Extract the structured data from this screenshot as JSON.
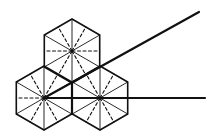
{
  "diagram": {
    "stroke_color": "#111111",
    "background": "#ffffff",
    "hexagons": [
      {
        "id": "top",
        "cx": 72,
        "cy": 51,
        "r": 32
      },
      {
        "id": "left",
        "cx": 44,
        "cy": 98,
        "r": 32
      },
      {
        "id": "right",
        "cx": 100,
        "cy": 98,
        "r": 32
      }
    ],
    "rays": [
      {
        "id": "diagonal-ray",
        "x1": 44,
        "y1": 98,
        "x2": 199,
        "y2": 12
      },
      {
        "id": "horizontal-ray",
        "x1": 44,
        "y1": 98,
        "x2": 205,
        "y2": 98
      }
    ]
  }
}
